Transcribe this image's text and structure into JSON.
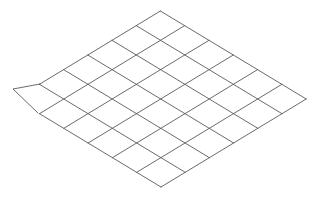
{
  "figure": {
    "width": 320,
    "height": 203,
    "background": "#ffffff",
    "stroke_color": "#5a5a5a",
    "stroke_width": 0.9,
    "grid": {
      "origin_bottom": [
        161,
        187
      ],
      "step_a": [
        24.2,
        -14.67
      ],
      "step_b": [
        -24.3,
        -14.67
      ],
      "count_a": 6,
      "count_b": 6,
      "truncated_cell": {
        "a": 0,
        "b": 5
      }
    },
    "flap": {
      "points": [
        [
          40,
          84
        ],
        [
          13,
          89
        ],
        [
          38,
          113
        ]
      ]
    }
  }
}
